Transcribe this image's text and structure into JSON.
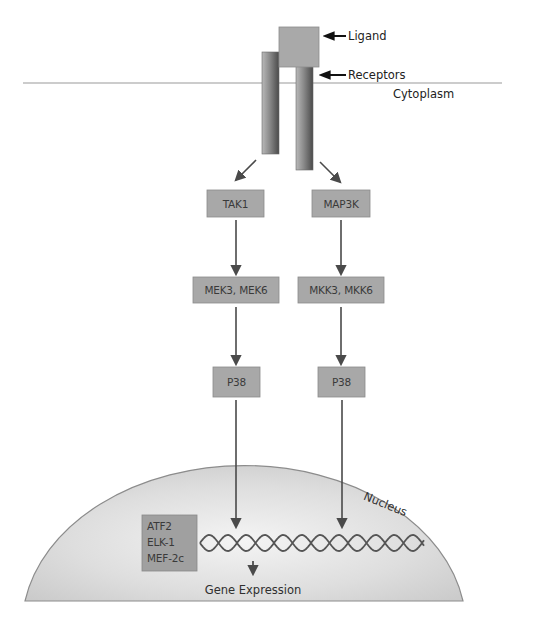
{
  "labels": {
    "ligand": "Ligand",
    "receptors": "Receptors",
    "cytoplasm": "Cytoplasm",
    "nucleus": "Nucleus",
    "gene_expression": "Gene Expression"
  },
  "pathways": [
    {
      "name": "left",
      "kinases": [
        "TAK1",
        "MEK3, MEK6",
        "P38"
      ]
    },
    {
      "name": "right",
      "kinases": [
        "MAP3K",
        "MKK3, MKK6",
        "P38"
      ]
    }
  ],
  "transcription_factors": [
    "ATF2",
    "ELK-1",
    "MEF-2c"
  ],
  "colors": {
    "box_fill": "#a8a8a8",
    "box_stroke": "#8a8a8a",
    "arrow": "#4a4a4a",
    "membrane": "#9a9a9a",
    "nucleus_outline": "#8c8c8c",
    "dna": "#555555"
  }
}
